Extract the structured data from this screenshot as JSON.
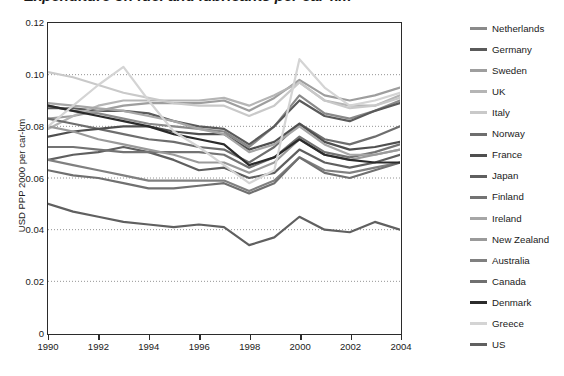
{
  "title": "Expenditure on fuel and lubricants per car-km",
  "axis": {
    "y_label": "USD PPP 2000 per car-km",
    "y_ticks": [
      "0.12",
      "0.10",
      "0.08",
      "0.06",
      "0.04",
      "0.02",
      "0"
    ],
    "x_ticks": [
      "1990",
      "1992",
      "1994",
      "1996",
      "1998",
      "2000",
      "2002",
      "2004"
    ]
  },
  "chart_data": {
    "type": "line",
    "title": "Expenditure on fuel and lubricants per car-km",
    "xlabel": "",
    "ylabel": "USD PPP 2000 per car-km",
    "xlim": [
      1990,
      2004
    ],
    "ylim": [
      0,
      0.12
    ],
    "grid": "horizontal-dotted",
    "legend_position": "right",
    "x": [
      1990,
      1991,
      1992,
      1993,
      1994,
      1995,
      1996,
      1997,
      1998,
      1999,
      2000,
      2001,
      2002,
      2003,
      2004
    ],
    "series": [
      {
        "name": "Netherlands",
        "color": "#8a8a8a",
        "values": [
          0.088,
          0.086,
          0.085,
          0.083,
          0.081,
          0.08,
          0.079,
          0.078,
          0.072,
          0.08,
          0.092,
          0.085,
          0.083,
          0.086,
          0.09
        ]
      },
      {
        "name": "Germany",
        "color": "#5a5a5a",
        "values": [
          0.087,
          0.087,
          0.086,
          0.086,
          0.085,
          0.082,
          0.08,
          0.079,
          0.073,
          0.08,
          0.09,
          0.084,
          0.082,
          0.086,
          0.089
        ]
      },
      {
        "name": "Sweden",
        "color": "#9e9e9e",
        "values": [
          0.083,
          0.084,
          0.086,
          0.088,
          0.089,
          0.089,
          0.089,
          0.09,
          0.086,
          0.091,
          0.098,
          0.092,
          0.09,
          0.092,
          0.095
        ]
      },
      {
        "name": "UK",
        "color": "#b5b5b5",
        "values": [
          0.079,
          0.084,
          0.088,
          0.09,
          0.09,
          0.09,
          0.09,
          0.091,
          0.088,
          0.092,
          0.097,
          0.09,
          0.088,
          0.088,
          0.092
        ]
      },
      {
        "name": "Italy",
        "color": "#c9c9c9",
        "values": [
          0.101,
          0.099,
          0.096,
          0.093,
          0.091,
          0.089,
          0.088,
          0.088,
          0.084,
          0.088,
          0.097,
          0.09,
          0.087,
          0.088,
          0.091
        ]
      },
      {
        "name": "Norway",
        "color": "#6e6e6e",
        "values": [
          0.083,
          0.081,
          0.079,
          0.077,
          0.075,
          0.074,
          0.072,
          0.071,
          0.066,
          0.072,
          0.081,
          0.075,
          0.073,
          0.076,
          0.08
        ]
      },
      {
        "name": "France",
        "color": "#4f4f4f",
        "values": [
          0.076,
          0.078,
          0.079,
          0.08,
          0.08,
          0.078,
          0.077,
          0.077,
          0.071,
          0.074,
          0.081,
          0.074,
          0.071,
          0.072,
          0.074
        ]
      },
      {
        "name": "Japan",
        "color": "#5f5f5f",
        "values": [
          0.067,
          0.069,
          0.07,
          0.072,
          0.07,
          0.067,
          0.063,
          0.064,
          0.06,
          0.062,
          0.071,
          0.066,
          0.064,
          0.066,
          0.069
        ]
      },
      {
        "name": "Finland",
        "color": "#737373",
        "values": [
          0.072,
          0.072,
          0.071,
          0.07,
          0.07,
          0.07,
          0.07,
          0.069,
          0.064,
          0.068,
          0.076,
          0.07,
          0.068,
          0.07,
          0.073
        ]
      },
      {
        "name": "Ireland",
        "color": "#a6a6a6",
        "values": [
          0.089,
          0.088,
          0.087,
          0.086,
          0.084,
          0.082,
          0.079,
          0.077,
          0.07,
          0.073,
          0.08,
          0.073,
          0.069,
          0.069,
          0.071
        ]
      },
      {
        "name": "New Zealand",
        "color": "#9a9a9a",
        "values": [
          0.08,
          0.078,
          0.075,
          0.073,
          0.071,
          0.069,
          0.066,
          0.066,
          0.062,
          0.066,
          0.075,
          0.069,
          0.067,
          0.069,
          0.071
        ]
      },
      {
        "name": "Australia",
        "color": "#808080",
        "values": [
          0.067,
          0.065,
          0.063,
          0.061,
          0.059,
          0.059,
          0.059,
          0.059,
          0.055,
          0.059,
          0.068,
          0.063,
          0.062,
          0.064,
          0.066
        ]
      },
      {
        "name": "Canada",
        "color": "#707070",
        "values": [
          0.063,
          0.061,
          0.06,
          0.058,
          0.056,
          0.056,
          0.057,
          0.058,
          0.054,
          0.058,
          0.068,
          0.062,
          0.06,
          0.063,
          0.066
        ]
      },
      {
        "name": "Denmark",
        "color": "#2b2b2b",
        "values": [
          0.088,
          0.086,
          0.084,
          0.082,
          0.08,
          0.077,
          0.075,
          0.073,
          0.065,
          0.068,
          0.075,
          0.069,
          0.067,
          0.066,
          0.066
        ]
      },
      {
        "name": "Greece",
        "color": "#d4d4d4",
        "values": [
          0.08,
          0.088,
          0.096,
          0.103,
          0.09,
          0.078,
          0.072,
          0.065,
          0.058,
          0.063,
          0.106,
          0.095,
          0.088,
          0.09,
          0.093
        ]
      },
      {
        "name": "US",
        "color": "#606060",
        "values": [
          0.05,
          0.047,
          0.045,
          0.043,
          0.042,
          0.041,
          0.042,
          0.041,
          0.034,
          0.037,
          0.045,
          0.04,
          0.039,
          0.043,
          0.04
        ]
      }
    ]
  }
}
